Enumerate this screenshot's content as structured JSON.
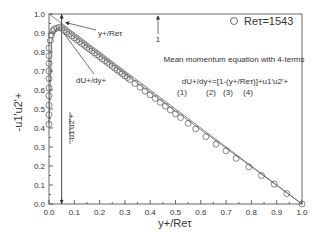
{
  "chart_data": {
    "type": "scatter",
    "title": "",
    "xlabel": "y+/Reτ",
    "ylabel": "-u1'u2'+",
    "xlim": [
      0.0,
      1.0
    ],
    "ylim": [
      0.0,
      1.0
    ],
    "xticks": [
      "0.0",
      "0.1",
      "0.2",
      "0.3",
      "0.4",
      "0.5",
      "0.6",
      "0.7",
      "0.8",
      "0.9",
      "1.0"
    ],
    "yticks": [
      "0.0",
      "0.1",
      "0.2",
      "0.3",
      "0.4",
      "0.5",
      "0.6",
      "0.7",
      "0.8",
      "0.9",
      "1.0"
    ],
    "grid": false,
    "legend": {
      "position": "top-right",
      "entries": [
        {
          "marker": "open-circle",
          "label": "Reτ=1543"
        }
      ]
    },
    "series": [
      {
        "name": "Reτ=1543",
        "marker": "open-circle",
        "points": [
          [
            0.0,
            0.42
          ],
          [
            0.0,
            0.47
          ],
          [
            0.0,
            0.52
          ],
          [
            0.0,
            0.57
          ],
          [
            0.0,
            0.61
          ],
          [
            0.0,
            0.66
          ],
          [
            0.0,
            0.7
          ],
          [
            0.0,
            0.74
          ],
          [
            0.0,
            0.78
          ],
          [
            0.0,
            0.82
          ],
          [
            0.005,
            0.86
          ],
          [
            0.01,
            0.89
          ],
          [
            0.015,
            0.91
          ],
          [
            0.02,
            0.92
          ],
          [
            0.03,
            0.925
          ],
          [
            0.04,
            0.93
          ],
          [
            0.05,
            0.925
          ],
          [
            0.06,
            0.915
          ],
          [
            0.07,
            0.905
          ],
          [
            0.08,
            0.895
          ],
          [
            0.09,
            0.885
          ],
          [
            0.1,
            0.875
          ],
          [
            0.11,
            0.865
          ],
          [
            0.12,
            0.855
          ],
          [
            0.13,
            0.845
          ],
          [
            0.14,
            0.835
          ],
          [
            0.15,
            0.825
          ],
          [
            0.16,
            0.815
          ],
          [
            0.17,
            0.805
          ],
          [
            0.18,
            0.795
          ],
          [
            0.19,
            0.785
          ],
          [
            0.2,
            0.775
          ],
          [
            0.21,
            0.765
          ],
          [
            0.22,
            0.755
          ],
          [
            0.23,
            0.745
          ],
          [
            0.24,
            0.735
          ],
          [
            0.25,
            0.725
          ],
          [
            0.26,
            0.715
          ],
          [
            0.27,
            0.705
          ],
          [
            0.28,
            0.695
          ],
          [
            0.29,
            0.685
          ],
          [
            0.3,
            0.675
          ],
          [
            0.31,
            0.665
          ],
          [
            0.32,
            0.655
          ],
          [
            0.34,
            0.635
          ],
          [
            0.36,
            0.615
          ],
          [
            0.38,
            0.595
          ],
          [
            0.4,
            0.575
          ],
          [
            0.42,
            0.555
          ],
          [
            0.44,
            0.535
          ],
          [
            0.46,
            0.515
          ],
          [
            0.48,
            0.495
          ],
          [
            0.5,
            0.475
          ],
          [
            0.52,
            0.455
          ],
          [
            0.55,
            0.425
          ],
          [
            0.58,
            0.395
          ],
          [
            0.62,
            0.355
          ],
          [
            0.66,
            0.315
          ],
          [
            0.7,
            0.28
          ],
          [
            0.74,
            0.24
          ],
          [
            0.79,
            0.195
          ],
          [
            0.84,
            0.15
          ],
          [
            0.89,
            0.105
          ],
          [
            0.94,
            0.055
          ],
          [
            1.0,
            0.0
          ]
        ]
      },
      {
        "name": "total-stress-line",
        "line": true,
        "points": [
          [
            0.0,
            1.0
          ],
          [
            1.0,
            0.0
          ]
        ]
      },
      {
        "name": "fit-line",
        "line": true,
        "points": [
          [
            0.0,
            0.42
          ],
          [
            0.01,
            0.85
          ],
          [
            0.02,
            0.91
          ],
          [
            0.04,
            0.93
          ],
          [
            0.06,
            0.918
          ],
          [
            0.1,
            0.88
          ],
          [
            1.0,
            0.0
          ]
        ]
      }
    ],
    "annotations": {
      "y_over_re": "y+/Reτ",
      "du_dy": "dU+/dy+",
      "stress_label": "-u1'u2'+",
      "one": "1",
      "equation_title": "Mean momentum equation with 4-terms",
      "equation": "dU+/dy+=[1-(y+/Reτ)]+u1'u2'+",
      "term_labels": [
        "(1)",
        "(2)",
        "(3)",
        "(4)"
      ],
      "vline_x": 0.05
    }
  }
}
